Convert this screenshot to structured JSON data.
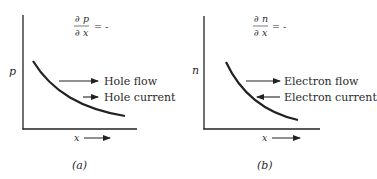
{
  "figure": {
    "panels": [
      {
        "id": "a",
        "caption": "(a)",
        "y_axis_label": "p",
        "x_axis_label": "x",
        "gradient": {
          "numerator": "∂ p",
          "denominator": "∂ x",
          "relation": "= -"
        },
        "arrows": [
          {
            "label": "Hole flow",
            "direction": "right"
          },
          {
            "label": "Hole current",
            "direction": "right"
          }
        ],
        "curve": "decreasing concentration"
      },
      {
        "id": "b",
        "caption": "(b)",
        "y_axis_label": "n",
        "x_axis_label": "x",
        "gradient": {
          "numerator": "∂ n",
          "denominator": "∂ x",
          "relation": "= -"
        },
        "arrows": [
          {
            "label": "Electron flow",
            "direction": "right"
          },
          {
            "label": "Electron current",
            "direction": "left"
          }
        ],
        "curve": "decreasing concentration"
      }
    ],
    "colors": {
      "ink": "#222222",
      "background": "#ffffff"
    }
  }
}
